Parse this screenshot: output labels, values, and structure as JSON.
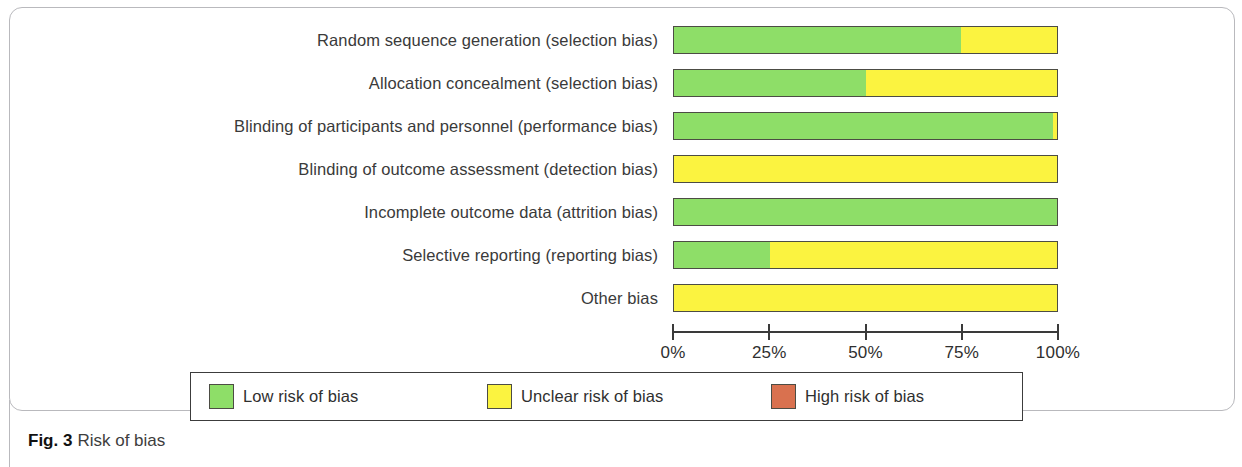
{
  "figure": {
    "caption_number": "Fig. 3",
    "caption_text": "Risk of bias"
  },
  "legend": {
    "items": [
      {
        "label": "Low risk of bias",
        "color": "#8ede68",
        "key": "low"
      },
      {
        "label": "Unclear risk of bias",
        "color": "#fbf340",
        "key": "unclear"
      },
      {
        "label": "High risk of bias",
        "color": "#d9714f",
        "key": "high"
      }
    ]
  },
  "axis": {
    "ticks": [
      "0%",
      "25%",
      "50%",
      "75%",
      "100%"
    ],
    "tick_values": [
      0,
      25,
      50,
      75,
      100
    ]
  },
  "chart_data": {
    "type": "bar",
    "orientation": "horizontal",
    "stacked": true,
    "normalized_percent": true,
    "title": "Risk of bias",
    "xlabel": "",
    "ylabel": "",
    "xlim": [
      0,
      100
    ],
    "grid": false,
    "legend_position": "bottom",
    "categories": [
      "Random sequence generation (selection bias)",
      "Allocation concealment (selection bias)",
      "Blinding of participants and personnel (performance bias)",
      "Blinding of outcome assessment (detection bias)",
      "Incomplete outcome data (attrition bias)",
      "Selective reporting (reporting bias)",
      "Other bias"
    ],
    "series": [
      {
        "name": "Low risk of bias",
        "color": "#8ede68",
        "values": [
          75,
          50,
          99,
          0,
          100,
          25,
          0
        ]
      },
      {
        "name": "Unclear risk of bias",
        "color": "#fbf340",
        "values": [
          25,
          50,
          1,
          100,
          0,
          75,
          100
        ]
      },
      {
        "name": "High risk of bias",
        "color": "#d9714f",
        "values": [
          0,
          0,
          0,
          0,
          0,
          0,
          0
        ]
      }
    ]
  }
}
